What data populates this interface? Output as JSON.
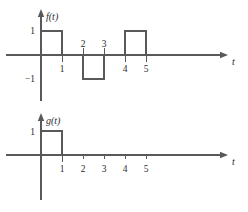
{
  "figure": {
    "stroke_color": "#58595b",
    "text_color": "#2b2b2b",
    "background": "#ffffff"
  },
  "charts": [
    {
      "id": "chart-f",
      "vertical_axis_label": "f(t)",
      "horizontal_axis_label": "t",
      "y_labels": {
        "positive_one": "1",
        "negative_one": "−1"
      },
      "x_tick_labels": [
        "1",
        "2",
        "3",
        "4",
        "5"
      ]
    },
    {
      "id": "chart-g",
      "vertical_axis_label": "g(t)",
      "horizontal_axis_label": "t",
      "y_labels": {
        "positive_one": "1"
      },
      "x_tick_labels": [
        "1",
        "2",
        "3",
        "4",
        "5"
      ]
    }
  ],
  "chart_data": [
    {
      "type": "line",
      "id": "f-of-t",
      "title": "f(t)",
      "xlabel": "t",
      "ylabel": "f(t)",
      "xlim": [
        -0.2,
        8.8
      ],
      "ylim": [
        -1.6,
        1.6
      ],
      "grid": false,
      "legend": "none",
      "xticks": [
        1,
        2,
        3,
        4,
        5
      ],
      "xticklabels": [
        "1",
        "2",
        "3",
        "4",
        "5"
      ],
      "yticks": [
        -1,
        1
      ],
      "yticklabels": [
        "−1",
        "1"
      ],
      "description": "Piecewise-constant rectangular pulse train: +1 on 0<t<1, 0 on 1<t<2, −1 on 2<t<3, 0 on 3<t<4, +1 on 4<t<5, 0 for t>5",
      "segments": [
        {
          "t_start": 0,
          "t_end": 1,
          "value": 1
        },
        {
          "t_start": 1,
          "t_end": 2,
          "value": 0
        },
        {
          "t_start": 2,
          "t_end": 3,
          "value": -1
        },
        {
          "t_start": 3,
          "t_end": 4,
          "value": 0
        },
        {
          "t_start": 4,
          "t_end": 5,
          "value": 1
        },
        {
          "t_start": 5,
          "t_end": 8.8,
          "value": 0
        }
      ],
      "x": [
        0,
        0,
        1,
        1,
        2,
        2,
        3,
        3,
        4,
        4,
        5,
        5,
        8.8
      ],
      "y": [
        0,
        1,
        1,
        0,
        0,
        -1,
        -1,
        0,
        0,
        1,
        1,
        0,
        0
      ]
    },
    {
      "type": "line",
      "id": "g-of-t",
      "title": "g(t)",
      "xlabel": "t",
      "ylabel": "g(t)",
      "xlim": [
        -0.2,
        8.8
      ],
      "ylim": [
        -1.6,
        1.6
      ],
      "grid": false,
      "legend": "none",
      "xticks": [
        1,
        2,
        3,
        4,
        5
      ],
      "xticklabels": [
        "1",
        "2",
        "3",
        "4",
        "5"
      ],
      "yticks": [
        1
      ],
      "yticklabels": [
        "1"
      ],
      "description": "Single unit rectangular pulse: +1 on 0<t<1, 0 elsewhere",
      "segments": [
        {
          "t_start": 0,
          "t_end": 1,
          "value": 1
        },
        {
          "t_start": 1,
          "t_end": 8.8,
          "value": 0
        }
      ],
      "x": [
        0,
        0,
        1,
        1,
        8.8
      ],
      "y": [
        0,
        1,
        1,
        0,
        0
      ]
    }
  ]
}
